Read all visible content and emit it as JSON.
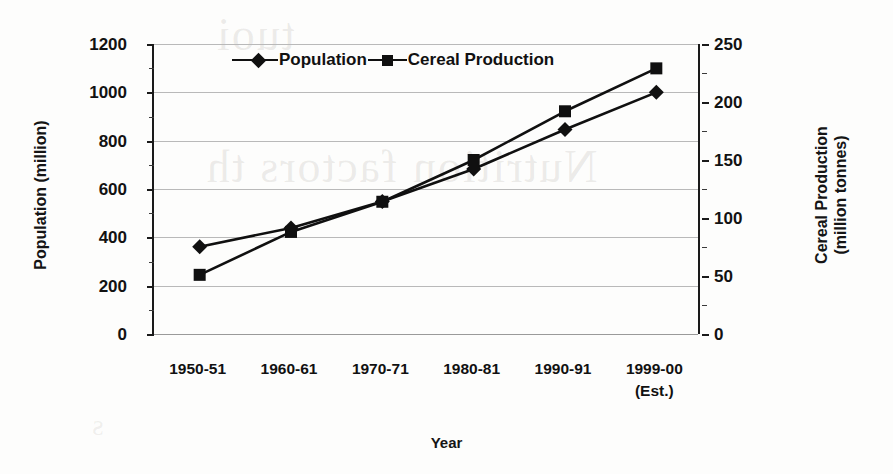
{
  "chart_data": {
    "type": "line",
    "title": "",
    "xlabel": "Year",
    "categories": [
      "1950-51",
      "1960-61",
      "1970-71",
      "1980-81",
      "1990-91",
      "1999-00"
    ],
    "category_notes": [
      "",
      "",
      "",
      "",
      "",
      "(Est.)"
    ],
    "grid": true,
    "legend_position": "top-center",
    "axes": {
      "left": {
        "label": "Population (million)",
        "ticks": [
          0,
          200,
          400,
          600,
          800,
          1000,
          1200
        ],
        "ylim": [
          0,
          1200
        ],
        "minor_ticks": [
          100,
          300,
          500,
          700,
          900,
          1100
        ]
      },
      "right": {
        "label_line1": "Cereal Production",
        "label_line2": "(million tonnes)",
        "ticks": [
          0,
          50,
          100,
          150,
          200,
          250
        ],
        "ylim": [
          0,
          250
        ],
        "minor_ticks": [
          25,
          75,
          125,
          175,
          225
        ]
      }
    },
    "series": [
      {
        "name": "Population",
        "axis": "left",
        "unit": "million",
        "marker": "diamond",
        "values": [
          361,
          439,
          548,
          683,
          846,
          1000
        ]
      },
      {
        "name": "Cereal Production",
        "axis": "right",
        "unit": "million tonnes",
        "marker": "square",
        "values": [
          51,
          88,
          114,
          150,
          192,
          229
        ]
      }
    ],
    "colors": {
      "series": "#101010",
      "grid": "#b9b9b9",
      "axis": "#1a1a1a",
      "text": "#121212",
      "background": "#fdfdfc"
    }
  },
  "background_bleed": {
    "line1": "tuoi",
    "line2": "Nutrition factors th",
    "line3": "s"
  }
}
